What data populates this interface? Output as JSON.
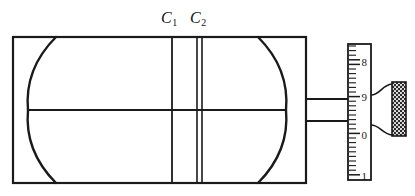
{
  "figure": {
    "background_color": "#ffffff",
    "line_color": "#1a1a1a",
    "width": 415,
    "height": 196
  },
  "labels": {
    "c1": {
      "base": "C",
      "sub": "1",
      "x": 161,
      "y": 9
    },
    "c2": {
      "base": "C",
      "sub": "2",
      "x": 190,
      "y": 9
    }
  },
  "housing": {
    "name": "rectangular-housing",
    "x": 13,
    "y": 37,
    "width": 293,
    "height": 146,
    "stroke_width": 2.2
  },
  "lenses": [
    {
      "name": "left-lens-surface",
      "description": "convex curve bulging to the right",
      "top_x": 56,
      "top_y": 37,
      "vertex_x": 28,
      "vertex_y": 110,
      "bottom_x": 56,
      "bottom_y": 183,
      "stroke_width": 2.4
    },
    {
      "name": "right-lens-surface",
      "description": "convex curve bulging to the left",
      "top_x": 258,
      "top_y": 37,
      "vertex_x": 286,
      "vertex_y": 110,
      "bottom_x": 258,
      "bottom_y": 183,
      "stroke_width": 2.4
    }
  ],
  "plates": [
    {
      "name": "plate-c1",
      "x": 172,
      "y1": 37,
      "y2": 183,
      "stroke_width": 1.8,
      "double": false
    },
    {
      "name": "plate-c2-left",
      "x": 197,
      "y1": 37,
      "y2": 183,
      "stroke_width": 1.6,
      "double": true
    },
    {
      "name": "plate-c2-right",
      "x": 202,
      "y1": 37,
      "y2": 183,
      "stroke_width": 1.6,
      "double": true
    }
  ],
  "optical_axis": {
    "name": "optical-axis-line",
    "x1": 28,
    "x2": 286,
    "y": 110,
    "stroke_width": 1.8
  },
  "connecting_rod": {
    "name": "connecting-rod",
    "x1": 306,
    "x2": 351,
    "top_y": 99,
    "bottom_y": 121,
    "stroke_width": 1.8
  },
  "scale": {
    "name": "graduated-ruler",
    "x": 348,
    "y": 44,
    "width": 23,
    "height": 136,
    "stroke_width": 1.8,
    "numbers": [
      {
        "value": "8",
        "y": 62
      },
      {
        "value": "9",
        "y": 97
      },
      {
        "value": "0",
        "y": 135
      },
      {
        "value": "1",
        "y": 176
      }
    ],
    "tick_spacing": 4.6,
    "major_tick_length": 11,
    "minor_tick_length": 7,
    "number_font_size": 11
  },
  "knob": {
    "name": "knurled-adjustment-knob",
    "x": 392,
    "y": 82,
    "width": 14,
    "height": 54,
    "pattern": "cross-hatch-diamond",
    "taper_top_y": 95,
    "taper_bottom_y": 125,
    "stroke_width": 1.6
  }
}
